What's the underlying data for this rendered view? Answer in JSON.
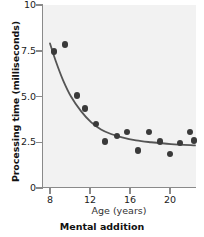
{
  "chart_data": {
    "type": "scatter",
    "title": "Mental addition",
    "xlabel": "Age (years)",
    "ylabel": "Processing time (milliseconds)",
    "xlim": [
      7.2,
      22.6
    ],
    "ylim": [
      0,
      10
    ],
    "xticks": [
      8,
      12,
      16,
      20
    ],
    "xtick_labels": [
      "8",
      "12",
      "16",
      "20"
    ],
    "yticks": [
      0,
      2.5,
      5.0,
      7.5,
      10
    ],
    "ytick_labels": [
      "0",
      "2.5",
      "5.0",
      "7.5",
      "10"
    ],
    "grid": false,
    "legend": null,
    "marker_color": "#3a3a3a",
    "curve_color": "#555555",
    "plot_background": "#f2f2f2",
    "axis_color": "#8a8a8a",
    "points": [
      {
        "x": 8.3,
        "y": 7.45
      },
      {
        "x": 9.4,
        "y": 7.85
      },
      {
        "x": 10.6,
        "y": 5.05
      },
      {
        "x": 11.4,
        "y": 4.35
      },
      {
        "x": 12.5,
        "y": 3.5
      },
      {
        "x": 13.4,
        "y": 2.55
      },
      {
        "x": 14.6,
        "y": 2.85
      },
      {
        "x": 15.6,
        "y": 3.05
      },
      {
        "x": 16.7,
        "y": 2.05
      },
      {
        "x": 17.8,
        "y": 3.05
      },
      {
        "x": 18.9,
        "y": 2.55
      },
      {
        "x": 19.9,
        "y": 1.85
      },
      {
        "x": 20.9,
        "y": 2.45
      },
      {
        "x": 21.9,
        "y": 3.05
      },
      {
        "x": 22.3,
        "y": 2.6
      }
    ],
    "fit_curve": {
      "description": "decaying exponential fit",
      "points": [
        {
          "x": 7.9,
          "y": 7.9
        },
        {
          "x": 8.5,
          "y": 6.9
        },
        {
          "x": 9.2,
          "y": 5.9
        },
        {
          "x": 10.0,
          "y": 5.0
        },
        {
          "x": 11.0,
          "y": 4.2
        },
        {
          "x": 12.0,
          "y": 3.6
        },
        {
          "x": 13.0,
          "y": 3.2
        },
        {
          "x": 14.0,
          "y": 2.95
        },
        {
          "x": 15.0,
          "y": 2.78
        },
        {
          "x": 16.5,
          "y": 2.6
        },
        {
          "x": 18.0,
          "y": 2.5
        },
        {
          "x": 20.0,
          "y": 2.4
        },
        {
          "x": 22.4,
          "y": 2.33
        }
      ]
    }
  }
}
